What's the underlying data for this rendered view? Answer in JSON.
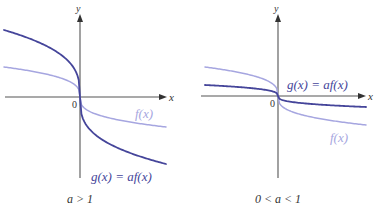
{
  "colors": {
    "f_curve": "#a6a6e0",
    "g_curve": "#45459a",
    "axis": "#555555",
    "text": "#333333"
  },
  "panels": [
    {
      "id": "left",
      "caption": "a > 1",
      "axis_labels": {
        "x": "x",
        "y": "y",
        "origin": "0"
      },
      "labels": {
        "f": "f(x)",
        "g": "g(x) = af(x)"
      },
      "origin": [
        80,
        97
      ],
      "f_scale": 30,
      "g_scale": 67
    },
    {
      "id": "right",
      "caption": "0 < a < 1",
      "axis_labels": {
        "x": "x",
        "y": "y",
        "origin": "0"
      },
      "labels": {
        "f": "f(x)",
        "g": "g(x) = af(x)"
      },
      "origin": [
        278,
        96
      ],
      "f_scale": 29,
      "g_scale": 11
    }
  ],
  "chart_data": [
    {
      "type": "line",
      "title": "Vertical stretch: a > 1",
      "caption": "a > 1",
      "xlabel": "x",
      "ylabel": "y",
      "series": [
        {
          "name": "f(x)",
          "shape": "decreasing cube-root-like curve through origin",
          "relative_scale": 1.0
        },
        {
          "name": "g(x) = af(x)",
          "shape": "vertical stretch of f",
          "relative_scale": 2.25
        }
      ],
      "grid": false
    },
    {
      "type": "line",
      "title": "Vertical compression: 0 < a < 1",
      "caption": "0 < a < 1",
      "xlabel": "x",
      "ylabel": "y",
      "series": [
        {
          "name": "f(x)",
          "shape": "decreasing cube-root-like curve through origin",
          "relative_scale": 1.0
        },
        {
          "name": "g(x) = af(x)",
          "shape": "vertical compression of f",
          "relative_scale": 0.38
        }
      ],
      "grid": false
    }
  ]
}
